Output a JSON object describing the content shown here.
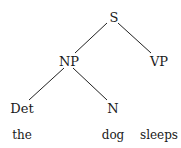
{
  "tree": {
    "root": "S",
    "nodes": {
      "s": {
        "label": "S",
        "x": 114,
        "y": 18
      },
      "np": {
        "label": "NP",
        "x": 69,
        "y": 62
      },
      "vp": {
        "label": "VP",
        "x": 159,
        "y": 62
      },
      "det": {
        "label": "Det",
        "x": 22,
        "y": 109
      },
      "n": {
        "label": "N",
        "x": 113,
        "y": 109
      }
    },
    "leaves": {
      "the": {
        "label": "the",
        "x": 22,
        "y": 135
      },
      "dog": {
        "label": "dog",
        "x": 113,
        "y": 135
      },
      "sleeps": {
        "label": "sleeps",
        "x": 159,
        "y": 135
      }
    },
    "edges": [
      {
        "from": "S",
        "to": "NP"
      },
      {
        "from": "S",
        "to": "VP"
      },
      {
        "from": "NP",
        "to": "Det"
      },
      {
        "from": "NP",
        "to": "N"
      }
    ]
  },
  "colors": {
    "line": "#222222",
    "text": "#1a1a1a",
    "background": "#ffffff"
  }
}
